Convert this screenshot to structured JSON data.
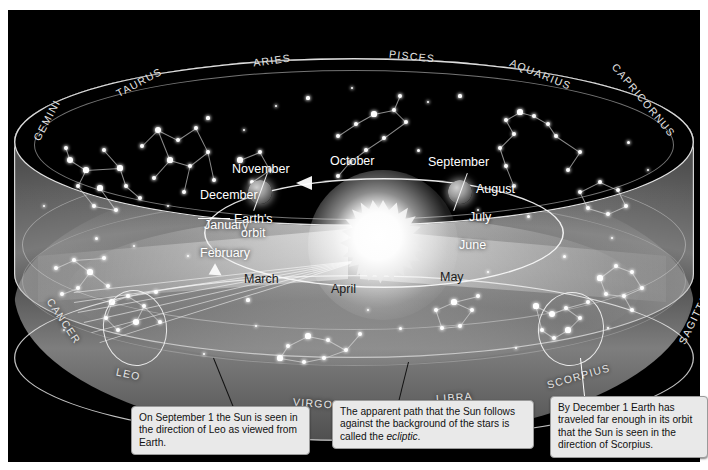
{
  "figure": {
    "background_color": "#000000",
    "frame_color": "#ffffff"
  },
  "constellations": [
    {
      "name": "GEMINI",
      "position": "upper-left"
    },
    {
      "name": "TAURUS",
      "position": "upper-left"
    },
    {
      "name": "ARIES",
      "position": "top"
    },
    {
      "name": "PISCES",
      "position": "top"
    },
    {
      "name": "AQUARIUS",
      "position": "upper-right"
    },
    {
      "name": "CAPRICORNUS",
      "position": "upper-right"
    },
    {
      "name": "SAGITTARIUS",
      "position": "lower-right"
    },
    {
      "name": "SCORPIUS",
      "position": "bottom-right"
    },
    {
      "name": "LIBRA",
      "position": "bottom"
    },
    {
      "name": "VIRGO",
      "position": "bottom"
    },
    {
      "name": "LEO",
      "position": "bottom-left"
    },
    {
      "name": "CANCER",
      "position": "lower-left"
    }
  ],
  "months": [
    {
      "name": "October",
      "tone": "light"
    },
    {
      "name": "November",
      "tone": "light"
    },
    {
      "name": "December",
      "tone": "light"
    },
    {
      "name": "January",
      "tone": "light"
    },
    {
      "name": "February",
      "tone": "light"
    },
    {
      "name": "March",
      "tone": "dark"
    },
    {
      "name": "April",
      "tone": "dark"
    },
    {
      "name": "May",
      "tone": "dark"
    },
    {
      "name": "June",
      "tone": "light"
    },
    {
      "name": "July",
      "tone": "light"
    },
    {
      "name": "August",
      "tone": "light"
    },
    {
      "name": "September",
      "tone": "light"
    }
  ],
  "orbit_label": {
    "line1": "Earth's",
    "line2": "orbit"
  },
  "bodies": {
    "sun": "Sun",
    "earth_november": "Earth",
    "earth_september": "Earth"
  },
  "captions": [
    {
      "id": "caption-leo",
      "text": "On September 1 the Sun is seen in the direction of Leo as viewed from Earth.",
      "parts": [
        {
          "t": "On September 1 the Sun is seen in the direction of Leo as viewed from Earth.",
          "style": "normal"
        }
      ]
    },
    {
      "id": "caption-ecliptic",
      "text": "The apparent path that the Sun follows against the background of the stars is called the ecliptic.",
      "parts": [
        {
          "t": "The apparent path that the Sun follows against the background of the stars is called the ",
          "style": "normal"
        },
        {
          "t": "ecliptic",
          "style": "italic"
        },
        {
          "t": ".",
          "style": "normal"
        }
      ]
    },
    {
      "id": "caption-scorpius",
      "text": "By December 1 Earth has traveled far enough in its orbit that the Sun is seen in the direction of Scorpius.",
      "parts": [
        {
          "t": "By December 1 Earth has traveled far enough in its orbit that the Sun is seen in the direction of Scorpius.",
          "style": "normal"
        }
      ]
    }
  ],
  "colors": {
    "star": "#ffffff",
    "label": "#e6e6e6",
    "caption_bg": "#e9e9e9",
    "caption_text": "#111111",
    "sun": "#ffffff"
  }
}
